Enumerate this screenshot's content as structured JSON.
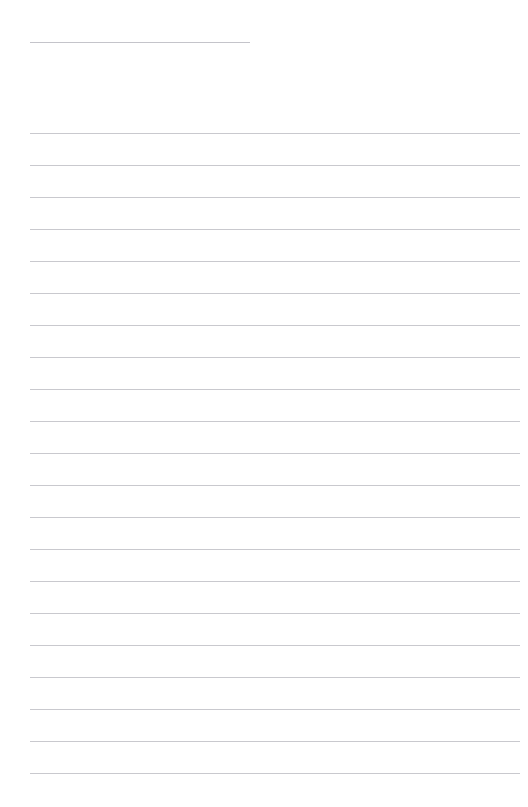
{
  "document": {
    "kind": "ruled-notebook-page",
    "background_color": "#ffffff",
    "rule_color": "#c9c9ce",
    "page_width": 528,
    "page_height": 807,
    "title_line": {
      "label": "title-rule",
      "text": "",
      "x_start": 30,
      "x_end": 250,
      "y": 42
    },
    "body_rules": {
      "x_start": 30,
      "x_end": 520,
      "first_y": 133,
      "spacing": 32,
      "count": 21,
      "y_positions": [
        133,
        165,
        197,
        229,
        261,
        293,
        325,
        357,
        389,
        421,
        453,
        485,
        517,
        549,
        581,
        613,
        645,
        677,
        709,
        741,
        773
      ]
    },
    "line_contents": [
      "",
      "",
      "",
      "",
      "",
      "",
      "",
      "",
      "",
      "",
      "",
      "",
      "",
      "",
      "",
      "",
      "",
      "",
      "",
      "",
      ""
    ]
  }
}
